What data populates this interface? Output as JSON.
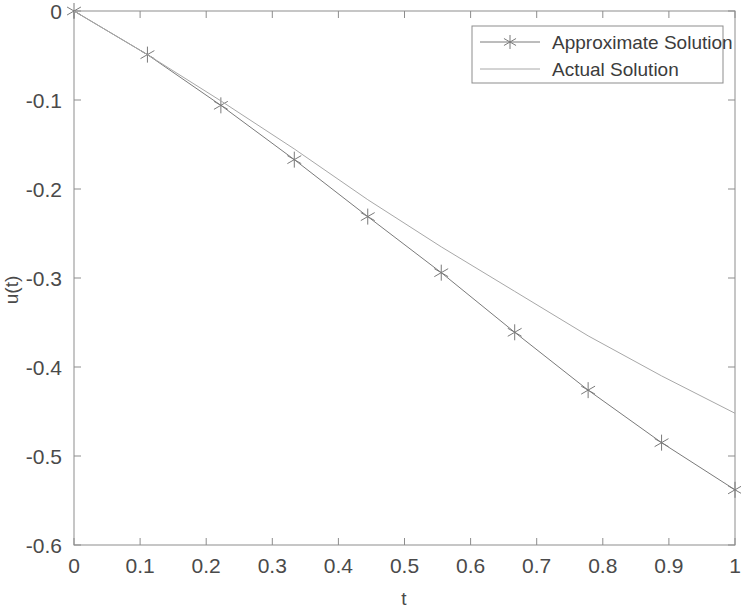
{
  "chart_data": {
    "type": "line",
    "title": "",
    "xlabel": "t",
    "ylabel": "u(t)",
    "xlim": [
      0,
      1
    ],
    "ylim": [
      -0.6,
      0
    ],
    "xticks": [
      "0",
      "0.1",
      "0.2",
      "0.3",
      "0.4",
      "0.5",
      "0.6",
      "0.7",
      "0.8",
      "0.9",
      "1"
    ],
    "xtick_values": [
      0,
      0.1,
      0.2,
      0.3,
      0.4,
      0.5,
      0.6,
      0.7,
      0.8,
      0.9,
      1
    ],
    "yticks": [
      "0",
      "-0.1",
      "-0.2",
      "-0.3",
      "-0.4",
      "-0.5",
      "-0.6"
    ],
    "ytick_values": [
      0,
      -0.1,
      -0.2,
      -0.3,
      -0.4,
      -0.5,
      -0.6
    ],
    "grid": false,
    "legend_position": "top-right",
    "series": [
      {
        "name": "Approximate Solution",
        "marker": "star",
        "linestyle": "solid",
        "color": "#7a7a7a",
        "x": [
          0,
          0.1111,
          0.2222,
          0.3333,
          0.4444,
          0.5556,
          0.6667,
          0.7778,
          0.8889,
          1
        ],
        "values": [
          0,
          -0.049,
          -0.106,
          -0.167,
          -0.231,
          -0.294,
          -0.361,
          -0.426,
          -0.485,
          -0.538
        ]
      },
      {
        "name": "Actual Solution",
        "marker": "none",
        "linestyle": "solid",
        "color": "#a8a8a8",
        "x": [
          0,
          0.1111,
          0.2222,
          0.3333,
          0.4444,
          0.5556,
          0.6667,
          0.7778,
          0.8889,
          1
        ],
        "values": [
          0,
          -0.049,
          -0.101,
          -0.155,
          -0.212,
          -0.265,
          -0.315,
          -0.365,
          -0.41,
          -0.452
        ]
      }
    ]
  },
  "legend": {
    "entries": [
      {
        "label": "Approximate Solution"
      },
      {
        "label": "Actual Solution"
      }
    ]
  },
  "axes": {
    "x_label": "t",
    "y_label": "u(t)"
  }
}
